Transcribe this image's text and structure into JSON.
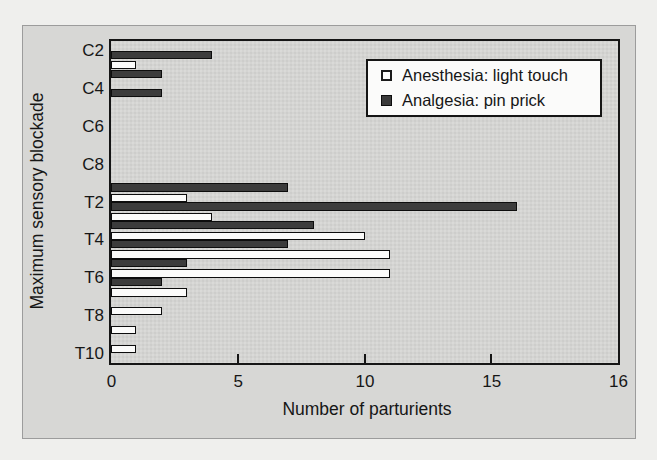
{
  "figure": {
    "xlabel": "Number of parturients",
    "ylabel": "Maximum sensory blockade"
  },
  "legend": {
    "position": "upper right",
    "items": [
      {
        "label": "Anesthesia: light touch",
        "swatch": "open-square",
        "color": "#fbfbfa"
      },
      {
        "label": "Analgesia: pin prick",
        "swatch": "filled-square",
        "color": "#3c3c3c"
      }
    ]
  },
  "chart_data": {
    "type": "bar",
    "orientation": "horizontal",
    "title": "",
    "xlabel": "Number of parturients",
    "ylabel": "Maximum sensory blockade",
    "xlim": [
      0,
      16
    ],
    "grid": false,
    "legend_position": "upper right",
    "categories": [
      "C2",
      "C3",
      "C4",
      "C5",
      "C6",
      "C7",
      "C8",
      "T1",
      "T2",
      "T3",
      "T4",
      "T5",
      "T6",
      "T7",
      "T8",
      "T9",
      "T10"
    ],
    "visible_category_labels": [
      "C2",
      "C4",
      "C6",
      "C8",
      "T2",
      "T4",
      "T6",
      "T8",
      "T10"
    ],
    "series": [
      {
        "name": "Anesthesia: light touch",
        "color": "#fbfbfa",
        "values": [
          0,
          1,
          0,
          0,
          0,
          0,
          0,
          0,
          3,
          4,
          10,
          11,
          11,
          3,
          2,
          1,
          1
        ]
      },
      {
        "name": "Analgesia: pin prick",
        "color": "#3c3c3c",
        "values": [
          4,
          2,
          2,
          0,
          0,
          0,
          0,
          7,
          16,
          8,
          7,
          3,
          2,
          0,
          0,
          0,
          0
        ]
      }
    ],
    "x_axis": {
      "ticks": [
        {
          "label": "0",
          "pct": 0
        },
        {
          "label": "5",
          "pct": 25
        },
        {
          "label": "10",
          "pct": 50
        },
        {
          "label": "15",
          "pct": 75
        },
        {
          "label": "16",
          "pct": 100
        }
      ]
    }
  }
}
